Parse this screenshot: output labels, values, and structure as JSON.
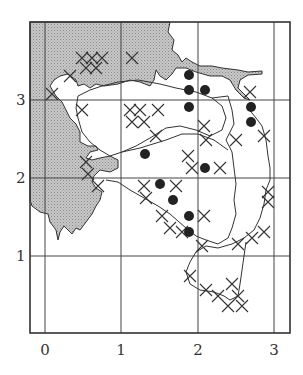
{
  "map": {
    "frame": {
      "x": 30,
      "y": 22,
      "w": 260,
      "h": 311
    },
    "x_axis": {
      "ticks": [
        {
          "label": "0",
          "px": 45
        },
        {
          "label": "1",
          "px": 121
        },
        {
          "label": "2",
          "px": 198
        },
        {
          "label": "3",
          "px": 274
        }
      ]
    },
    "y_axis": {
      "ticks": [
        {
          "label": "3",
          "py": 100
        },
        {
          "label": "2",
          "py": 178
        },
        {
          "label": "1",
          "py": 256
        }
      ]
    },
    "legend_symbols": {
      "dot": "filled-circle-record",
      "cross": "x-mark-record",
      "shaded": "land-area-stippled"
    },
    "colors": {
      "land": "#b9b9b9",
      "line": "#333333",
      "dot": "#222222",
      "background": "#ffffff"
    },
    "dots": [
      [
        189,
        75
      ],
      [
        189,
        90
      ],
      [
        205,
        90
      ],
      [
        189,
        107
      ],
      [
        251,
        107
      ],
      [
        251,
        122
      ],
      [
        145,
        154
      ],
      [
        205,
        168
      ],
      [
        160,
        184
      ],
      [
        173,
        200
      ],
      [
        189,
        216
      ],
      [
        189,
        232
      ]
    ]
  }
}
